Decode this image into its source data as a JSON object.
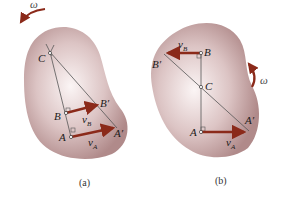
{
  "figures": [
    {
      "id": "a",
      "caption": "(a)",
      "omega_label": "ω",
      "omega_direction": "counterclockwise",
      "points": {
        "C": "C",
        "B": "B",
        "A": "A",
        "B_prime": "B′",
        "A_prime": "A′"
      },
      "velocities": {
        "vB_main": "v",
        "vB_sub": "B",
        "vA_main": "v",
        "vA_sub": "A"
      }
    },
    {
      "id": "b",
      "caption": "(b)",
      "omega_label": "ω",
      "omega_direction": "counterclockwise",
      "points": {
        "C": "C",
        "B": "B",
        "A": "A",
        "B_prime": "B′",
        "A_prime": "A′"
      },
      "velocities": {
        "vB_main": "v",
        "vB_sub": "B",
        "vA_main": "v",
        "vA_sub": "A"
      }
    }
  ],
  "colors": {
    "body_center": "#f7eeee",
    "body_edge": "#b08888",
    "arrow": "#8b2a1a",
    "line": "#555555"
  }
}
